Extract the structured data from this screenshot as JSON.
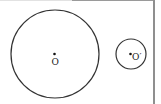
{
  "diagram": {
    "type": "two-circles",
    "circles": [
      {
        "name": "large",
        "center_label": "O",
        "cx": 55,
        "cy": 54,
        "r": 44
      },
      {
        "name": "small",
        "center_label": "O′",
        "cx": 131,
        "cy": 54,
        "r": 15
      }
    ],
    "stroke_color": "#333333"
  }
}
